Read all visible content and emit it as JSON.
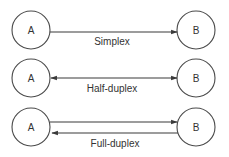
{
  "diagram": {
    "rows": [
      {
        "mode": "Simplex",
        "left": "A",
        "right": "B"
      },
      {
        "mode": "Half-duplex",
        "left": "A",
        "right": "B"
      },
      {
        "mode": "Full-duplex",
        "left": "A",
        "right": "B"
      }
    ]
  }
}
